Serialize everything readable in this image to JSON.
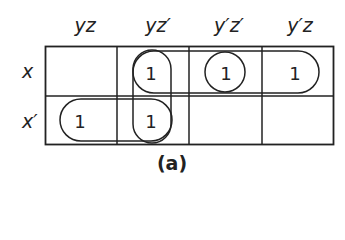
{
  "diagram": {
    "type": "karnaugh-map",
    "columns": [
      "yz",
      "yz′",
      "y′z′",
      "y′z"
    ],
    "rows": [
      "x",
      "x′"
    ],
    "cells": [
      [
        "",
        "1",
        "1",
        "1"
      ],
      [
        "1",
        "1",
        "",
        ""
      ]
    ],
    "groups": [
      {
        "name": "group-yz-prime-column",
        "cells": [
          [
            0,
            1
          ],
          [
            1,
            1
          ]
        ]
      },
      {
        "name": "group-x-row-right",
        "cells": [
          [
            0,
            1
          ],
          [
            0,
            2
          ],
          [
            0,
            3
          ]
        ]
      },
      {
        "name": "group-y-prime-z-prime-single",
        "cells": [
          [
            0,
            2
          ]
        ]
      },
      {
        "name": "group-x-prime-row-left",
        "cells": [
          [
            1,
            0
          ],
          [
            1,
            1
          ]
        ]
      }
    ],
    "caption": "(a)"
  }
}
